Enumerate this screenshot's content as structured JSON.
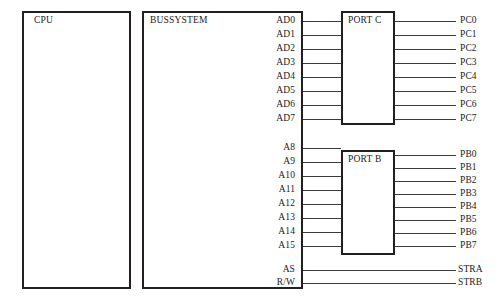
{
  "diagram": {
    "blocks": {
      "cpu": {
        "label": "CPU"
      },
      "bussystem": {
        "label": "BUSSYSTEM"
      },
      "port_c": {
        "label": "PORT C"
      },
      "port_b": {
        "label": "PORT B"
      }
    },
    "bus_signals": {
      "data_bus": [
        "AD0",
        "AD1",
        "AD2",
        "AD3",
        "AD4",
        "AD5",
        "AD6",
        "AD7"
      ],
      "address_bus": [
        "A8",
        "A9",
        "A10",
        "A11",
        "A12",
        "A13",
        "A14",
        "A15"
      ],
      "control_bus": [
        "AS",
        "R/W"
      ]
    },
    "port_outputs": {
      "port_c": [
        "PC0",
        "PC1",
        "PC2",
        "PC3",
        "PC4",
        "PC5",
        "PC6",
        "PC7"
      ],
      "port_b": [
        "PB0",
        "PB1",
        "PB2",
        "PB3",
        "PB4",
        "PB5",
        "PB6",
        "PB7"
      ],
      "strobes": [
        "STRA",
        "STRB"
      ]
    },
    "colors": {
      "line": "#231f20",
      "wire": "#3a3a3a",
      "text": "#1a1a1a",
      "background": "#ffffff"
    }
  }
}
